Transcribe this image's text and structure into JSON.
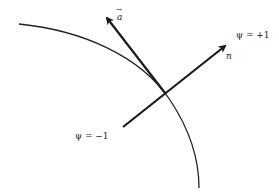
{
  "diagram": {
    "type": "level-set boundary with normal and velocity vectors",
    "curve": {
      "name": "interface-boundary",
      "color": "#222222"
    },
    "vectors": [
      {
        "name": "a",
        "label": "a",
        "has_vector_arrow": true
      },
      {
        "name": "n",
        "label": "n",
        "has_vector_arrow": false
      }
    ],
    "labels": {
      "a_vector": "a",
      "a_arrow": "→",
      "n_vector": "n",
      "psi_plus": "ψ = +1",
      "psi_minus": "ψ = −1"
    },
    "colors": {
      "stroke": "#1a1a1a",
      "text": "#222222",
      "background": "#ffffff"
    }
  }
}
